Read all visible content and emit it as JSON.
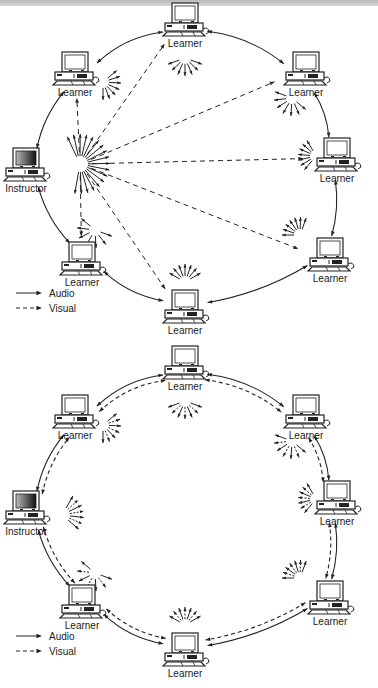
{
  "diagrams": [
    {
      "id": "diagram-1",
      "description": "Instructor-centered: visual broadcast from instructor to all learners, audio passed around the ring",
      "nodes": [
        {
          "label": "Instructor",
          "role": "instructor",
          "x": 26,
          "y": 168
        },
        {
          "label": "Learner",
          "role": "learner",
          "x": 75,
          "y": 72
        },
        {
          "label": "Learner",
          "role": "learner",
          "x": 185,
          "y": 23
        },
        {
          "label": "Learner",
          "role": "learner",
          "x": 306,
          "y": 72
        },
        {
          "label": "Learner",
          "role": "learner",
          "x": 337,
          "y": 158
        },
        {
          "label": "Learner",
          "role": "learner",
          "x": 330,
          "y": 258
        },
        {
          "label": "Learner",
          "role": "learner",
          "x": 185,
          "y": 310
        },
        {
          "label": "Learner",
          "role": "learner",
          "x": 82,
          "y": 262
        }
      ],
      "legend": {
        "audio": "Audio",
        "visual": "Visual"
      }
    },
    {
      "id": "diagram-2",
      "description": "Peer ring: both audio and visual links between neighbouring nodes",
      "nodes": [
        {
          "label": "Instructor",
          "role": "instructor",
          "x": 26,
          "y": 168
        },
        {
          "label": "Learner",
          "role": "learner",
          "x": 75,
          "y": 72
        },
        {
          "label": "Learner",
          "role": "learner",
          "x": 185,
          "y": 23
        },
        {
          "label": "Learner",
          "role": "learner",
          "x": 306,
          "y": 72
        },
        {
          "label": "Learner",
          "role": "learner",
          "x": 337,
          "y": 158
        },
        {
          "label": "Learner",
          "role": "learner",
          "x": 330,
          "y": 258
        },
        {
          "label": "Learner",
          "role": "learner",
          "x": 185,
          "y": 310
        },
        {
          "label": "Learner",
          "role": "learner",
          "x": 82,
          "y": 262
        }
      ],
      "legend": {
        "audio": "Audio",
        "visual": "Visual"
      }
    }
  ],
  "colors": {
    "line": "#222222",
    "background": "#ffffff",
    "topbar": "#c4c4c4"
  }
}
